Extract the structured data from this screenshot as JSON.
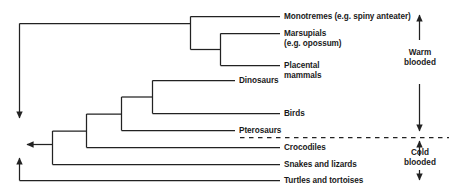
{
  "diagram": {
    "stroke_color": "#222222",
    "text_color": "#1a1a1a",
    "background": "#ffffff",
    "divider_style": "dashed"
  },
  "tips": [
    {
      "id": "monotremes",
      "label": "Monotremes (e.g. spiny anteater)"
    },
    {
      "id": "marsupials",
      "label": "Marsupials"
    },
    {
      "id": "marsupials_example",
      "label": "(e.g. opossum)"
    },
    {
      "id": "placental",
      "label": "Placental"
    },
    {
      "id": "placental_cont",
      "label": "mammals"
    },
    {
      "id": "dinosaurs",
      "label": "Dinosaurs"
    },
    {
      "id": "birds",
      "label": "Birds"
    },
    {
      "id": "pterosaurs",
      "label": "Pterosaurs"
    },
    {
      "id": "crocodiles",
      "label": "Crocodiles"
    },
    {
      "id": "snakes_lizards",
      "label": "Snakes and lizards"
    },
    {
      "id": "turtles_tortoises",
      "label": "Turtles and tortoises"
    }
  ],
  "annotations": {
    "warm_line1": "Warm",
    "warm_line2": "blooded",
    "cold_line1": "Cold",
    "cold_line2": "blooded"
  }
}
